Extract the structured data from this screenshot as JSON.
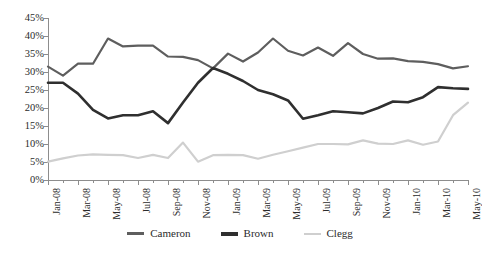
{
  "chart_data": {
    "type": "line",
    "title": "",
    "xlabel": "",
    "ylabel": "",
    "ylim": [
      0,
      45
    ],
    "ytick_labels": [
      "0%",
      "5%",
      "10%",
      "15%",
      "20%",
      "25%",
      "30%",
      "35%",
      "40%",
      "45%"
    ],
    "ytick_values": [
      0,
      5,
      10,
      15,
      20,
      25,
      30,
      35,
      40,
      45
    ],
    "grid": false,
    "legend_position": "bottom",
    "x": [
      "Jan-08",
      "Feb-08",
      "Mar-08",
      "Apr-08",
      "May-08",
      "Jun-08",
      "Jul-08",
      "Aug-08",
      "Sep-08",
      "Oct-08",
      "Nov-08",
      "Dec-08",
      "Jan-09",
      "Feb-09",
      "Mar-09",
      "Apr-09",
      "May-09",
      "Jun-09",
      "Jul-09",
      "Aug-09",
      "Sep-09",
      "Oct-09",
      "Nov-09",
      "Dec-09",
      "Jan-10",
      "Feb-10",
      "Mar-10",
      "Apr-10",
      "May-10"
    ],
    "xtick_labels": [
      "Jan-08",
      "Mar-08",
      "May-08",
      "Jul-08",
      "Sep-08",
      "Nov-08",
      "Jan-09",
      "Mar-09",
      "May-09",
      "Jul-09",
      "Sep-09",
      "Nov-09",
      "Jan-10",
      "Mar-10",
      "May-10"
    ],
    "xtick_indices": [
      0,
      2,
      4,
      6,
      8,
      10,
      12,
      14,
      16,
      18,
      20,
      22,
      24,
      26,
      28
    ],
    "series": [
      {
        "name": "Cameron",
        "color": "#5e5e5e",
        "values": [
          31.5,
          29.0,
          32.3,
          32.3,
          39.3,
          37.1,
          37.3,
          37.3,
          34.3,
          34.2,
          33.3,
          31.0,
          35.1,
          32.9,
          35.4,
          39.3,
          35.9,
          34.6,
          36.8,
          34.5,
          38.0,
          35.0,
          33.7,
          33.8,
          33.0,
          32.8,
          32.2,
          31.0,
          31.6
        ]
      },
      {
        "name": "Brown",
        "color": "#2f2f2f",
        "values": [
          27.0,
          27.0,
          24.0,
          19.5,
          17.1,
          18.0,
          18.0,
          19.1,
          15.8,
          21.5,
          27.0,
          31.1,
          29.5,
          27.5,
          25.0,
          23.8,
          22.1,
          17.0,
          18.0,
          19.1,
          18.8,
          18.5,
          20.0,
          21.8,
          21.6,
          23.0,
          25.8,
          25.5,
          25.3
        ]
      },
      {
        "name": "Clegg",
        "color": "#cfcfcf",
        "values": [
          5.1,
          6.0,
          6.8,
          7.1,
          7.0,
          6.9,
          6.1,
          7.0,
          6.1,
          10.4,
          5.1,
          6.9,
          7.0,
          6.9,
          5.9,
          7.0,
          8.0,
          9.0,
          10.0,
          10.0,
          9.9,
          11.0,
          10.1,
          10.0,
          11.0,
          9.8,
          10.7,
          18.0,
          21.5
        ]
      }
    ]
  },
  "legend": {
    "items": [
      {
        "label": "Cameron",
        "color": "#5e5e5e"
      },
      {
        "label": "Brown",
        "color": "#2f2f2f"
      },
      {
        "label": "Clegg",
        "color": "#cfcfcf"
      }
    ]
  }
}
